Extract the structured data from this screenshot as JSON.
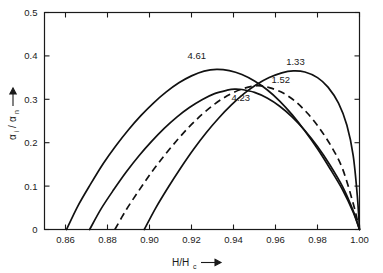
{
  "chart_data": {
    "type": "line",
    "title": "",
    "subtitle": "",
    "xlabel": "H/H_c",
    "xlabel_display": "H/H",
    "xlabel_sub": "c",
    "ylabel": "alpha_i/alpha_n",
    "ylabel_num": "α",
    "ylabel_num_sub": "i",
    "ylabel_den": "α",
    "ylabel_den_sub": "n",
    "ylabel_sep": "/",
    "xlim": [
      0.85,
      1.0
    ],
    "ylim": [
      0.0,
      0.5
    ],
    "grid": false,
    "legend": "inline-curve-labels",
    "xticks": [
      0.86,
      0.88,
      0.9,
      0.92,
      0.94,
      0.96,
      0.98,
      1.0
    ],
    "xticklabels": [
      "0.86",
      "0.88",
      "0.90",
      "0.92",
      "0.94",
      "0.96",
      "0.98",
      "1.00"
    ],
    "yticks": [
      0.0,
      0.1,
      0.2,
      0.3,
      0.4,
      0.5
    ],
    "yticklabels": [
      "0",
      "0.1",
      "0.2",
      "0.3",
      "0.4",
      "0.5"
    ],
    "series": [
      {
        "name": "4.61",
        "label": "4.61",
        "style": "solid",
        "label_x": 0.9225,
        "label_y": 0.392,
        "points": [
          [
            0.8605,
            0.0
          ],
          [
            0.866,
            0.055
          ],
          [
            0.872,
            0.105
          ],
          [
            0.878,
            0.152
          ],
          [
            0.884,
            0.193
          ],
          [
            0.89,
            0.23
          ],
          [
            0.896,
            0.263
          ],
          [
            0.902,
            0.292
          ],
          [
            0.908,
            0.317
          ],
          [
            0.914,
            0.338
          ],
          [
            0.92,
            0.354
          ],
          [
            0.926,
            0.365
          ],
          [
            0.932,
            0.369
          ],
          [
            0.938,
            0.366
          ],
          [
            0.944,
            0.357
          ],
          [
            0.95,
            0.342
          ],
          [
            0.956,
            0.322
          ],
          [
            0.962,
            0.296
          ],
          [
            0.968,
            0.264
          ],
          [
            0.974,
            0.227
          ],
          [
            0.98,
            0.186
          ],
          [
            0.986,
            0.14
          ],
          [
            0.992,
            0.091
          ],
          [
            0.997,
            0.04
          ],
          [
            1.0,
            0.0
          ]
        ]
      },
      {
        "name": "4.23",
        "label": "4.23",
        "style": "solid",
        "label_x": 0.9435,
        "label_y": 0.296,
        "points": [
          [
            0.8715,
            0.0
          ],
          [
            0.877,
            0.048
          ],
          [
            0.883,
            0.092
          ],
          [
            0.889,
            0.133
          ],
          [
            0.895,
            0.17
          ],
          [
            0.901,
            0.203
          ],
          [
            0.907,
            0.233
          ],
          [
            0.913,
            0.259
          ],
          [
            0.919,
            0.281
          ],
          [
            0.925,
            0.299
          ],
          [
            0.931,
            0.313
          ],
          [
            0.937,
            0.321
          ],
          [
            0.9405,
            0.3235
          ],
          [
            0.944,
            0.3225
          ],
          [
            0.95,
            0.316
          ],
          [
            0.956,
            0.303
          ],
          [
            0.962,
            0.284
          ],
          [
            0.968,
            0.259
          ],
          [
            0.974,
            0.228
          ],
          [
            0.98,
            0.191
          ],
          [
            0.986,
            0.148
          ],
          [
            0.992,
            0.098
          ],
          [
            0.997,
            0.043
          ],
          [
            1.0,
            0.0
          ]
        ]
      },
      {
        "name": "1.52",
        "label": "1.52",
        "style": "dashed",
        "label_x": 0.9625,
        "label_y": 0.338,
        "points": [
          [
            0.8835,
            0.0
          ],
          [
            0.889,
            0.046
          ],
          [
            0.895,
            0.09
          ],
          [
            0.901,
            0.132
          ],
          [
            0.907,
            0.17
          ],
          [
            0.913,
            0.205
          ],
          [
            0.919,
            0.237
          ],
          [
            0.925,
            0.265
          ],
          [
            0.931,
            0.289
          ],
          [
            0.937,
            0.308
          ],
          [
            0.943,
            0.322
          ],
          [
            0.949,
            0.33
          ],
          [
            0.953,
            0.331
          ],
          [
            0.957,
            0.327
          ],
          [
            0.963,
            0.316
          ],
          [
            0.969,
            0.297
          ],
          [
            0.975,
            0.269
          ],
          [
            0.981,
            0.233
          ],
          [
            0.987,
            0.188
          ],
          [
            0.992,
            0.139
          ],
          [
            0.997,
            0.06
          ],
          [
            1.0,
            0.0
          ]
        ]
      },
      {
        "name": "1.33",
        "label": "1.33",
        "style": "solid",
        "label_x": 0.9695,
        "label_y": 0.38,
        "points": [
          [
            0.8975,
            0.0
          ],
          [
            0.903,
            0.05
          ],
          [
            0.909,
            0.098
          ],
          [
            0.915,
            0.143
          ],
          [
            0.921,
            0.185
          ],
          [
            0.927,
            0.223
          ],
          [
            0.933,
            0.257
          ],
          [
            0.939,
            0.287
          ],
          [
            0.945,
            0.313
          ],
          [
            0.951,
            0.334
          ],
          [
            0.957,
            0.35
          ],
          [
            0.963,
            0.361
          ],
          [
            0.9685,
            0.3655
          ],
          [
            0.974,
            0.363
          ],
          [
            0.98,
            0.35
          ],
          [
            0.985,
            0.328
          ],
          [
            0.99,
            0.291
          ],
          [
            0.994,
            0.24
          ],
          [
            0.997,
            0.17
          ],
          [
            0.999,
            0.075
          ],
          [
            1.0,
            0.0
          ]
        ]
      }
    ]
  },
  "colors": {
    "axis": "#1a1a1a",
    "curve": "#111111",
    "background": "#ffffff"
  }
}
